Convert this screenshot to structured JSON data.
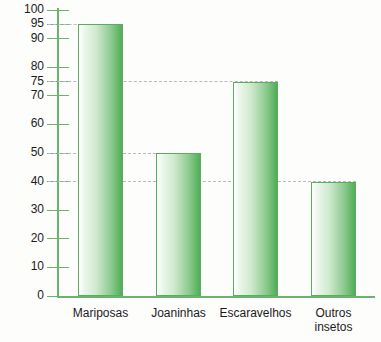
{
  "chart_data": {
    "type": "bar",
    "title": "",
    "xlabel": "",
    "ylabel": "",
    "categories": [
      "Mariposas",
      "Joaninhas",
      "Escaravelhos",
      "Outros insetos"
    ],
    "values": [
      95,
      50,
      75,
      40
    ],
    "ylim": [
      0,
      100
    ],
    "yticks": [
      0,
      10,
      20,
      30,
      40,
      50,
      60,
      70,
      75,
      80,
      90,
      95,
      100
    ],
    "ytick_labels": [
      "0",
      "10",
      "20",
      "30",
      "40",
      "50",
      "60",
      "70",
      "75",
      "80",
      "90",
      "95",
      "100"
    ],
    "gridlines": [
      {
        "value": 95,
        "extends_to_bar": 0,
        "style": "dashed"
      },
      {
        "value": 75,
        "extends_to_bar": 2,
        "style": "dashed"
      },
      {
        "value": 50,
        "extends_to_bar": 1,
        "style": "dashed"
      },
      {
        "value": 40,
        "extends_to_bar": 3,
        "style": "dashed"
      }
    ],
    "grid": true,
    "legend": null,
    "colors": {
      "bar_fill_light": "#ffffff",
      "bar_fill_dark": "#4fae55",
      "bar_outline": "#5cab60",
      "axis": "#6ab46e",
      "gridline": "#b9b9c4",
      "text": "#1b1b1b",
      "background": "#fdfdfc"
    }
  },
  "category_labels": [
    {
      "lines": [
        "Mariposas"
      ]
    },
    {
      "lines": [
        "Joaninhas"
      ]
    },
    {
      "lines": [
        "Escaravelhos"
      ]
    },
    {
      "lines": [
        "Outros",
        "insetos"
      ]
    }
  ]
}
